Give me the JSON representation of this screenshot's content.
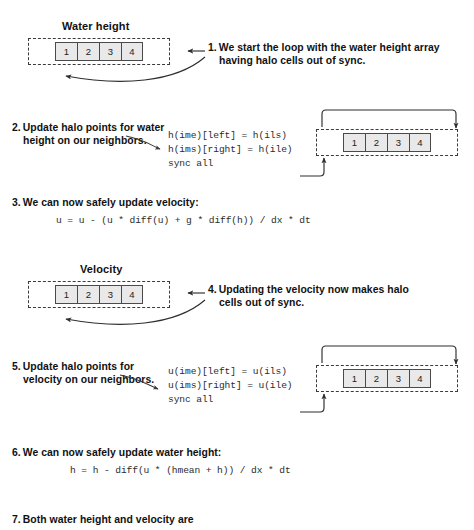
{
  "diagram": {
    "arrays": [
      {
        "id": "water-height-left",
        "title": "Water height",
        "cells": [
          "1",
          "2",
          "3",
          "4"
        ]
      },
      {
        "id": "water-height-right",
        "title": "",
        "cells": [
          "1",
          "2",
          "3",
          "4"
        ]
      },
      {
        "id": "velocity-left",
        "title": "Velocity",
        "cells": [
          "1",
          "2",
          "3",
          "4"
        ]
      },
      {
        "id": "velocity-right",
        "title": "",
        "cells": [
          "1",
          "2",
          "3",
          "4"
        ]
      }
    ],
    "steps": [
      {
        "number": "1.",
        "text": "We start the loop with the water height array having halo cells out of sync."
      },
      {
        "number": "2.",
        "text": "Update halo points for water height on our neighbors."
      },
      {
        "number": "3.",
        "text": "We can now safely update velocity:"
      },
      {
        "number": "4.",
        "text": "Updating the velocity now makes halo cells out of sync."
      },
      {
        "number": "5.",
        "text": "Update halo points for velocity on our neighbors."
      },
      {
        "number": "6.",
        "text": "We can now safely update water height:"
      },
      {
        "number": "7.",
        "text": "Both water height and velocity are"
      }
    ],
    "code_blocks": [
      {
        "id": "halo-exchange-height",
        "lines": [
          "h(ime)[left] = h(ils)",
          "h(ims)[right] = h(ile)",
          "sync all"
        ]
      },
      {
        "id": "update-velocity",
        "lines": [
          "u = u - (u * diff(u) + g * diff(h)) / dx * dt"
        ]
      },
      {
        "id": "halo-exchange-velocity",
        "lines": [
          "u(ime)[left] = u(ils)",
          "u(ims)[right] = u(ile)",
          "sync all"
        ]
      },
      {
        "id": "update-water-height",
        "lines": [
          "h = h - diff(u * (hmean + h)) / dx * dt"
        ]
      }
    ],
    "colors": {
      "cell_fill": "#e9e9e9",
      "cell_border": "#4a4a4a",
      "halo_border": "#3b3b3b",
      "text": "#111111",
      "code_text": "#2b2b2b",
      "connector": "#2e2e2e",
      "background": "#ffffff"
    }
  }
}
